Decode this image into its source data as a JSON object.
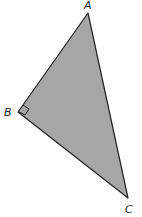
{
  "diagram": {
    "fill_color": "#a6a6a6",
    "stroke_color": "#222222",
    "vertices": [
      {
        "label": "A",
        "x": 88,
        "y": 13,
        "label_x": 87,
        "label_y": 9
      },
      {
        "label": "B",
        "x": 18,
        "y": 112,
        "label_x": 9,
        "label_y": 116
      },
      {
        "label": "C",
        "x": 128,
        "y": 198,
        "label_x": 129,
        "label_y": 213
      }
    ],
    "right_angle_at": "B"
  }
}
